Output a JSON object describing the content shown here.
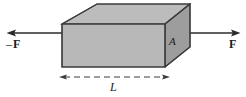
{
  "figure": {
    "type": "physics-diagram",
    "background_color": "#ffffff",
    "labels": {
      "force_left_sign": "–",
      "force_left": "F",
      "force_right": "F",
      "area": "A",
      "length": "L"
    },
    "colors": {
      "top_face": "#b9b9b9",
      "front_face": "#b6b6b6",
      "right_face": "#9a9a9a",
      "outline": "#3a3a3a",
      "arrow": "#2b2b2b",
      "dimension_line": "#3a3a3a",
      "text": "#1c1c1c"
    },
    "geometry": {
      "front_face": [
        [
          62,
          24
        ],
        [
          165,
          24
        ],
        [
          165,
          67
        ],
        [
          62,
          67
        ]
      ],
      "top_face": [
        [
          62,
          24
        ],
        [
          97,
          4
        ],
        [
          190,
          4
        ],
        [
          165,
          24
        ]
      ],
      "right_face": [
        [
          165,
          24
        ],
        [
          190,
          4
        ],
        [
          190,
          47
        ],
        [
          165,
          67
        ]
      ]
    },
    "arrows": {
      "left": {
        "tail_x": 62,
        "head_x": 8,
        "y": 33,
        "direction": "left"
      },
      "right": {
        "tail_x": 180,
        "head_x": 239,
        "y": 33,
        "direction": "right"
      }
    },
    "dimension": {
      "x_start": 61,
      "x_end": 168,
      "y": 77,
      "style": "dashed-double-arrow"
    }
  }
}
